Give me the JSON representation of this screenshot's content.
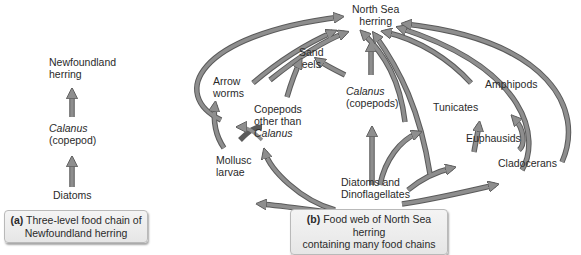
{
  "panel_a": {
    "nodes": {
      "top": [
        "Newfoundland",
        "herring"
      ],
      "mid_italic": "Calanus",
      "mid": "(copepod)",
      "bottom": "Diatoms"
    },
    "caption": {
      "letter": "(a)",
      "line1": "Three-level food chain of",
      "line2": "Newfoundland herring"
    }
  },
  "panel_b": {
    "nodes": {
      "herring": [
        "North Sea",
        "herring"
      ],
      "sand_eels": [
        "Sand",
        "eels"
      ],
      "arrow_worms": [
        "Arrow",
        "worms"
      ],
      "calanus_italic": "Calanus",
      "calanus": "(copepods)",
      "copepods_other": [
        "Copepods",
        "other than"
      ],
      "copepods_other_italic": "Calanus",
      "tunicates": "Tunicates",
      "amphipods": "Amphipods",
      "euphausids": "Euphausids",
      "cladocerans": "Cladocerans",
      "mollusc_larvae": [
        "Mollusc",
        "larvae"
      ],
      "diatoms": [
        "Diatoms and",
        "Dinoflagellates"
      ]
    },
    "caption": {
      "letter": "(b)",
      "line1": "Food web of North Sea herring",
      "line2": "containing many food chains"
    }
  },
  "colors": {
    "arrow_fill": "#8e8e8e",
    "arrow_stroke": "#5a5a5a",
    "caption_bg": "#ececec"
  }
}
